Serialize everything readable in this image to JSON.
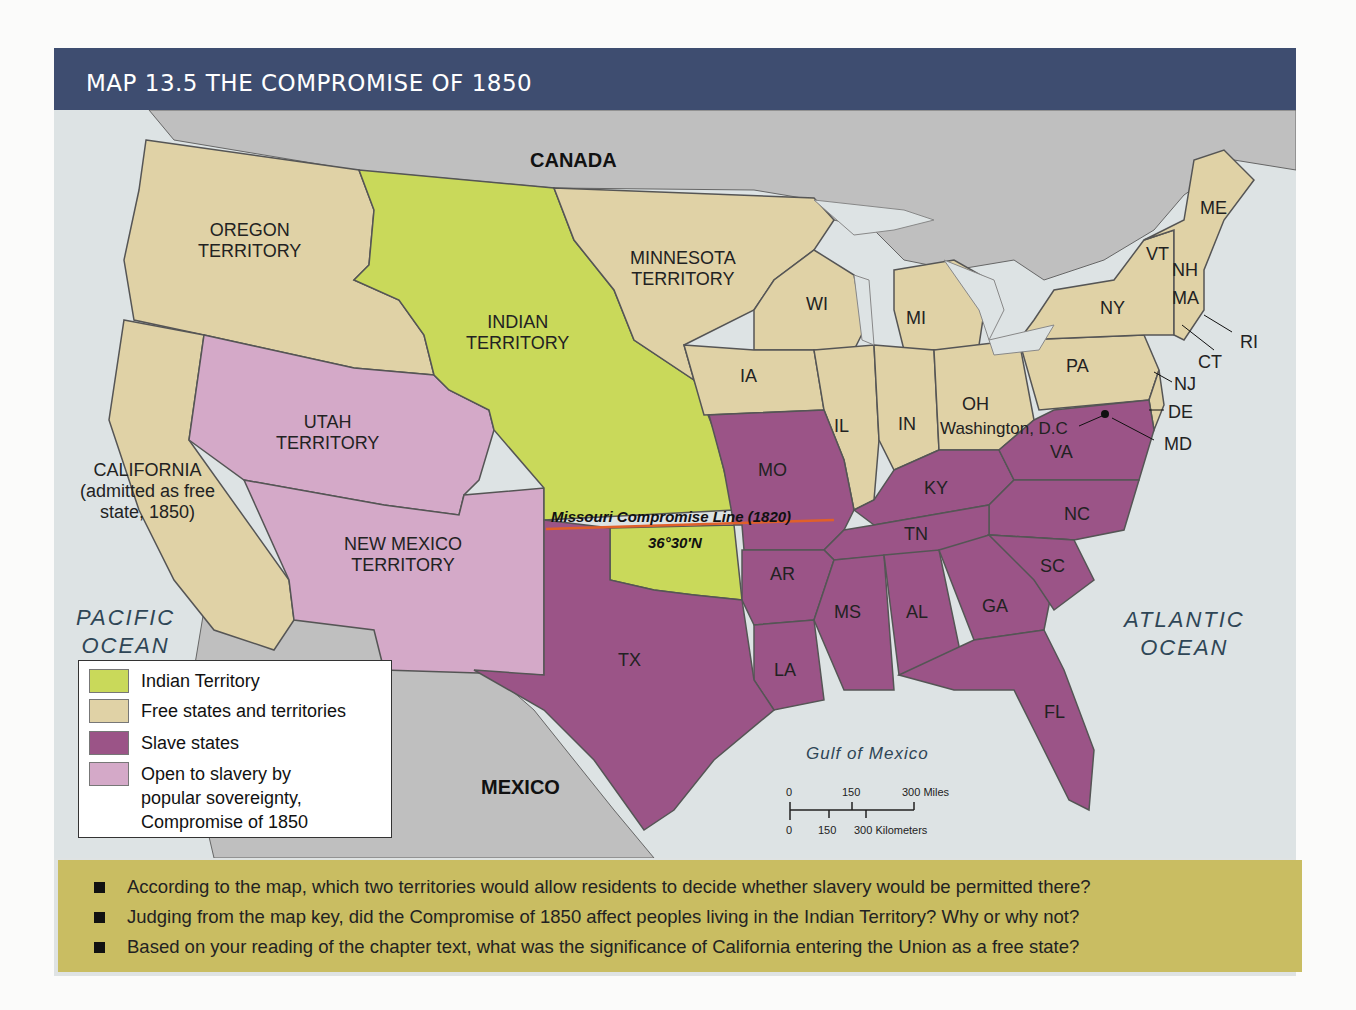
{
  "title": "MAP 13.5  THE COMPROMISE OF 1850",
  "colors": {
    "title_bar": "#3e4d70",
    "indian_territory": "#c9d95a",
    "free": "#e0d2a6",
    "slave": "#9b5487",
    "popular_sovereignty": "#d4a9c8",
    "water": "#dde3e4",
    "foreign": "#bfbfbf",
    "question_box": "#c9bd62",
    "compromise_line": "#e0602a"
  },
  "labels": {
    "canada": "CANADA",
    "mexico": "MEXICO",
    "pacific": [
      "PACIFIC",
      "OCEAN"
    ],
    "atlantic": [
      "ATLANTIC",
      "OCEAN"
    ],
    "gulf": "Gulf of Mexico",
    "oregon": [
      "OREGON",
      "TERRITORY"
    ],
    "indian": [
      "INDIAN",
      "TERRITORY"
    ],
    "minnesota": [
      "MINNESOTA",
      "TERRITORY"
    ],
    "utah": [
      "UTAH",
      "TERRITORY"
    ],
    "new_mexico": [
      "NEW MEXICO",
      "TERRITORY"
    ],
    "california": [
      "CALIFORNIA",
      "(admitted as free",
      "state, 1850)"
    ],
    "washington_dc": "Washington, D.C",
    "missouri_line": "Missouri Compromise Line (1820)",
    "latitude": "36°30′N",
    "states": {
      "ME": "ME",
      "VT": "VT",
      "NH": "NH",
      "MA": "MA",
      "RI": "RI",
      "CT": "CT",
      "NY": "NY",
      "NJ": "NJ",
      "PA": "PA",
      "DE": "DE",
      "MD": "MD",
      "WI": "WI",
      "MI": "MI",
      "IA": "IA",
      "IL": "IL",
      "IN": "IN",
      "OH": "OH",
      "VA": "VA",
      "KY": "KY",
      "MO": "MO",
      "NC": "NC",
      "TN": "TN",
      "AR": "AR",
      "SC": "SC",
      "MS": "MS",
      "AL": "AL",
      "GA": "GA",
      "TX": "TX",
      "LA": "LA",
      "FL": "FL"
    }
  },
  "legend": [
    {
      "label": "Indian Territory",
      "color": "#c9d95a"
    },
    {
      "label": "Free states and territories",
      "color": "#e0d2a6"
    },
    {
      "label": "Slave states",
      "color": "#9b5487"
    },
    {
      "label": "Open to slavery by popular sovereignty, Compromise of 1850",
      "lines": [
        "Open to slavery by",
        "popular sovereignty,",
        "Compromise of 1850"
      ],
      "color": "#d4a9c8"
    }
  ],
  "scale": {
    "miles": [
      "0",
      "150",
      "300 Miles"
    ],
    "km": [
      "0",
      "150",
      "300 Kilometers"
    ]
  },
  "questions": [
    "According to the map, which two territories would allow residents to decide whether slavery would be permitted there?",
    "Judging from the map key, did the Compromise of 1850 affect peoples living in the Indian Territory? Why or why not?",
    "Based on your reading of the chapter text, what was the significance of California entering the Union as a free state?"
  ]
}
